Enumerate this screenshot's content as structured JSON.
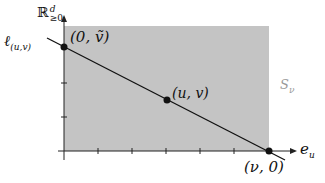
{
  "diagram": {
    "colors": {
      "region_fill": "#c4c4c4",
      "line": "#111111",
      "axis": "#222222",
      "region_label": "#9a9a9a"
    },
    "axes": {
      "y_label_base": "ℝ",
      "y_label_sup": "d",
      "y_label_sub": "≥0",
      "x_label_base": "e",
      "x_label_sub": "u"
    },
    "line_label": {
      "base": "ℓ",
      "sub": "(u,v)"
    },
    "points": [
      {
        "label": "(0, ṽ)",
        "x": 64,
        "y": 47
      },
      {
        "label": "(u, v)",
        "x": 167,
        "y": 100
      },
      {
        "label": "(ν, 0)",
        "x": 269,
        "y": 151
      }
    ],
    "region_label": {
      "base": "S",
      "sub": "ν"
    }
  }
}
